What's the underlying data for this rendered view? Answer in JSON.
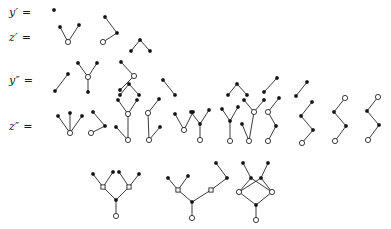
{
  "figure": {
    "kind": "rooted-tree-diagram",
    "background_color": "#ffffff",
    "ink_color": "#1a1a1a",
    "node_legend": {
      "filled_circle": "y-component vertex (solid black dot)",
      "hollow_circle": "z-component vertex (open circle)",
      "hollow_square": "intermediate branching vertex (open square)"
    }
  },
  "rows": [
    {
      "id": "row-y-prime",
      "label": "y′ =",
      "label_x": 9,
      "label_y": 6,
      "tree_count": 1
    },
    {
      "id": "row-z-prime",
      "label": "z′ =",
      "label_x": 9,
      "label_y": 31,
      "tree_count": 3
    },
    {
      "id": "row-y-dprime",
      "label": "y″ =",
      "label_x": 9,
      "label_y": 74,
      "tree_count": 8
    },
    {
      "id": "row-z-dprime",
      "label": "z″ =",
      "label_x": 9,
      "label_y": 120,
      "tree_count": 15
    }
  ],
  "geometry": {
    "dot_radius": 1.7,
    "circle_radius": 2.6,
    "square_size": 4.2,
    "edge_width": 0.85
  },
  "trees": [
    {
      "row": "row-y-prime",
      "name": "tree-y1-single-dot",
      "nodes": [
        {
          "x": 54,
          "y": 10,
          "t": "f"
        }
      ],
      "edges": []
    },
    {
      "row": "row-z-prime",
      "name": "tree-z1-cherry",
      "nodes": [
        {
          "x": 60,
          "y": 27,
          "t": "f"
        },
        {
          "x": 79,
          "y": 25,
          "t": "f"
        },
        {
          "x": 68,
          "y": 42,
          "t": "h"
        }
      ],
      "edges": [
        [
          0,
          2
        ],
        [
          1,
          2
        ]
      ]
    },
    {
      "row": "row-z-prime",
      "name": "tree-z2-path",
      "nodes": [
        {
          "x": 105,
          "y": 17,
          "t": "f"
        },
        {
          "x": 117,
          "y": 33,
          "t": "f"
        },
        {
          "x": 103,
          "y": 42,
          "t": "h"
        }
      ],
      "edges": [
        [
          0,
          1
        ],
        [
          1,
          2
        ]
      ]
    },
    {
      "row": "row-z-prime",
      "name": "tree-z3-cherry-open",
      "nodes": [
        {
          "x": 131,
          "y": 51,
          "t": "f"
        },
        {
          "x": 150,
          "y": 51,
          "t": "f"
        },
        {
          "x": 140,
          "y": 40,
          "t": "f"
        }
      ],
      "edges": [
        [
          0,
          2
        ],
        [
          1,
          2
        ]
      ]
    },
    {
      "row": "row-y-dprime",
      "name": "tree-yd1-edge",
      "nodes": [
        {
          "x": 68,
          "y": 74,
          "t": "f"
        },
        {
          "x": 55,
          "y": 91,
          "t": "f"
        }
      ],
      "edges": [
        [
          0,
          1
        ]
      ]
    },
    {
      "row": "row-y-dprime",
      "name": "tree-yd2-y-with-stem",
      "nodes": [
        {
          "x": 78,
          "y": 63,
          "t": "f"
        },
        {
          "x": 97,
          "y": 63,
          "t": "f"
        },
        {
          "x": 88,
          "y": 77,
          "t": "h"
        },
        {
          "x": 88,
          "y": 92,
          "t": "f"
        }
      ],
      "edges": [
        [
          0,
          2
        ],
        [
          1,
          2
        ],
        [
          2,
          3
        ]
      ]
    },
    {
      "row": "row-y-dprime",
      "name": "tree-yd3-zigzag-open",
      "nodes": [
        {
          "x": 121,
          "y": 62,
          "t": "f"
        },
        {
          "x": 134,
          "y": 76,
          "t": "h"
        },
        {
          "x": 120,
          "y": 90,
          "t": "f"
        }
      ],
      "edges": [
        [
          0,
          1
        ],
        [
          1,
          2
        ]
      ]
    },
    {
      "row": "row-y-dprime",
      "name": "tree-yd4-cherry",
      "nodes": [
        {
          "x": 120,
          "y": 95,
          "t": "f"
        },
        {
          "x": 139,
          "y": 95,
          "t": "f"
        },
        {
          "x": 129,
          "y": 84,
          "t": "f"
        }
      ],
      "edges": [
        [
          0,
          2
        ],
        [
          1,
          2
        ]
      ]
    },
    {
      "row": "row-y-dprime",
      "name": "tree-yd5-bend",
      "nodes": [
        {
          "x": 163,
          "y": 80,
          "t": "f"
        },
        {
          "x": 175,
          "y": 95,
          "t": "f"
        }
      ],
      "edges": [
        [
          0,
          1
        ]
      ]
    },
    {
      "row": "row-y-dprime",
      "name": "tree-yd6-cherry-right",
      "nodes": [
        {
          "x": 228,
          "y": 95,
          "t": "f"
        },
        {
          "x": 247,
          "y": 95,
          "t": "f"
        },
        {
          "x": 237,
          "y": 84,
          "t": "f"
        }
      ],
      "edges": [
        [
          0,
          2
        ],
        [
          1,
          2
        ]
      ]
    },
    {
      "row": "row-y-dprime",
      "name": "tree-yd7-chevron",
      "nodes": [
        {
          "x": 277,
          "y": 78,
          "t": "f"
        },
        {
          "x": 264,
          "y": 92,
          "t": "f"
        }
      ],
      "edges": [
        [
          0,
          1
        ]
      ]
    },
    {
      "row": "row-y-dprime",
      "name": "tree-yd8-short-edge",
      "nodes": [
        {
          "x": 307,
          "y": 82,
          "t": "f"
        },
        {
          "x": 296,
          "y": 96,
          "t": "f"
        }
      ],
      "edges": [
        [
          0,
          1
        ]
      ]
    },
    {
      "row": "row-z-dprime",
      "name": "tree-zd1-three-fan",
      "nodes": [
        {
          "x": 58,
          "y": 116,
          "t": "f"
        },
        {
          "x": 70,
          "y": 113,
          "t": "f"
        },
        {
          "x": 82,
          "y": 116,
          "t": "f"
        },
        {
          "x": 70,
          "y": 133,
          "t": "h"
        }
      ],
      "edges": [
        [
          0,
          3
        ],
        [
          1,
          3
        ],
        [
          2,
          3
        ]
      ]
    },
    {
      "row": "row-z-dprime",
      "name": "tree-zd2-path-cherry",
      "nodes": [
        {
          "x": 93,
          "y": 112,
          "t": "f"
        },
        {
          "x": 105,
          "y": 126,
          "t": "f"
        },
        {
          "x": 91,
          "y": 133,
          "t": "h"
        }
      ],
      "edges": [
        [
          0,
          1
        ],
        [
          1,
          2
        ]
      ]
    },
    {
      "row": "row-z-dprime",
      "name": "tree-zd3-double-branch",
      "nodes": [
        {
          "x": 118,
          "y": 100,
          "t": "f"
        },
        {
          "x": 137,
          "y": 100,
          "t": "f"
        },
        {
          "x": 128,
          "y": 114,
          "t": "h"
        },
        {
          "x": 116,
          "y": 127,
          "t": "f"
        },
        {
          "x": 128,
          "y": 140,
          "t": "h"
        }
      ],
      "edges": [
        [
          0,
          2
        ],
        [
          1,
          2
        ],
        [
          2,
          4
        ],
        [
          3,
          4
        ]
      ]
    },
    {
      "row": "row-z-dprime",
      "name": "tree-zd4-stem-cherry",
      "nodes": [
        {
          "x": 159,
          "y": 99,
          "t": "f"
        },
        {
          "x": 148,
          "y": 113,
          "t": "h"
        },
        {
          "x": 160,
          "y": 127,
          "t": "f"
        },
        {
          "x": 149,
          "y": 140,
          "t": "h"
        }
      ],
      "edges": [
        [
          0,
          1
        ],
        [
          1,
          3
        ],
        [
          2,
          3
        ]
      ]
    },
    {
      "row": "row-z-dprime",
      "name": "tree-zd5-v-open",
      "nodes": [
        {
          "x": 175,
          "y": 114,
          "t": "f"
        },
        {
          "x": 193,
          "y": 112,
          "t": "f"
        },
        {
          "x": 184,
          "y": 130,
          "t": "h"
        }
      ],
      "edges": [
        [
          0,
          2
        ],
        [
          1,
          2
        ]
      ]
    },
    {
      "row": "row-z-dprime",
      "name": "tree-zd6-y-stem-open",
      "nodes": [
        {
          "x": 191,
          "y": 112,
          "t": "f"
        },
        {
          "x": 209,
          "y": 110,
          "t": "f"
        },
        {
          "x": 200,
          "y": 124,
          "t": "f"
        },
        {
          "x": 200,
          "y": 140,
          "t": "h"
        }
      ],
      "edges": [
        [
          0,
          2
        ],
        [
          1,
          2
        ],
        [
          2,
          3
        ]
      ]
    },
    {
      "row": "row-z-dprime",
      "name": "tree-zd7-branch-tall",
      "nodes": [
        {
          "x": 222,
          "y": 109,
          "t": "f"
        },
        {
          "x": 238,
          "y": 107,
          "t": "f"
        },
        {
          "x": 230,
          "y": 121,
          "t": "f"
        },
        {
          "x": 230,
          "y": 141,
          "t": "h"
        }
      ],
      "edges": [
        [
          0,
          2
        ],
        [
          1,
          2
        ],
        [
          2,
          3
        ]
      ]
    },
    {
      "row": "row-z-dprime",
      "name": "tree-zd8-branch-wide",
      "nodes": [
        {
          "x": 244,
          "y": 100,
          "t": "f"
        },
        {
          "x": 264,
          "y": 100,
          "t": "f"
        },
        {
          "x": 254,
          "y": 112,
          "t": "h"
        },
        {
          "x": 242,
          "y": 124,
          "t": "f"
        },
        {
          "x": 249,
          "y": 141,
          "t": "h"
        }
      ],
      "edges": [
        [
          0,
          2
        ],
        [
          1,
          2
        ],
        [
          2,
          4
        ],
        [
          3,
          4
        ]
      ]
    },
    {
      "row": "row-z-dprime",
      "name": "tree-zd9-zig-open-top",
      "nodes": [
        {
          "x": 279,
          "y": 98,
          "t": "f"
        },
        {
          "x": 268,
          "y": 112,
          "t": "h"
        },
        {
          "x": 276,
          "y": 126,
          "t": "f"
        },
        {
          "x": 268,
          "y": 141,
          "t": "h"
        }
      ],
      "edges": [
        [
          0,
          1
        ],
        [
          1,
          2
        ],
        [
          2,
          3
        ]
      ]
    },
    {
      "row": "row-z-dprime",
      "name": "tree-zd10-zigzag-plain",
      "nodes": [
        {
          "x": 312,
          "y": 102,
          "t": "f"
        },
        {
          "x": 301,
          "y": 116,
          "t": "f"
        },
        {
          "x": 313,
          "y": 130,
          "t": "f"
        },
        {
          "x": 302,
          "y": 143,
          "t": "h"
        }
      ],
      "edges": [
        [
          0,
          1
        ],
        [
          1,
          2
        ],
        [
          2,
          3
        ]
      ]
    },
    {
      "row": "row-z-dprime",
      "name": "tree-zd11-zigzag-open-head",
      "nodes": [
        {
          "x": 345,
          "y": 98,
          "t": "h"
        },
        {
          "x": 334,
          "y": 112,
          "t": "f"
        },
        {
          "x": 346,
          "y": 126,
          "t": "f"
        },
        {
          "x": 335,
          "y": 141,
          "t": "h"
        }
      ],
      "edges": [
        [
          0,
          1
        ],
        [
          1,
          2
        ],
        [
          2,
          3
        ]
      ]
    },
    {
      "row": "row-z-dprime",
      "name": "tree-zd12-zigzag-open-head-2",
      "nodes": [
        {
          "x": 378,
          "y": 97,
          "t": "h"
        },
        {
          "x": 367,
          "y": 111,
          "t": "f"
        },
        {
          "x": 379,
          "y": 125,
          "t": "f"
        },
        {
          "x": 368,
          "y": 140,
          "t": "h"
        }
      ],
      "edges": [
        [
          0,
          1
        ],
        [
          1,
          2
        ],
        [
          2,
          3
        ]
      ]
    },
    {
      "row": "row-z-dprime",
      "name": "tree-zd13-symmetric-double",
      "nodes": [
        {
          "x": 93,
          "y": 174,
          "t": "f"
        },
        {
          "x": 113,
          "y": 172,
          "t": "f"
        },
        {
          "x": 103,
          "y": 187,
          "t": "sq"
        },
        {
          "x": 119,
          "y": 172,
          "t": "f"
        },
        {
          "x": 139,
          "y": 174,
          "t": "f"
        },
        {
          "x": 129,
          "y": 187,
          "t": "sq"
        },
        {
          "x": 116,
          "y": 200,
          "t": "f"
        },
        {
          "x": 116,
          "y": 216,
          "t": "h"
        }
      ],
      "edges": [
        [
          0,
          2
        ],
        [
          1,
          2
        ],
        [
          3,
          5
        ],
        [
          4,
          5
        ],
        [
          2,
          6
        ],
        [
          5,
          6
        ],
        [
          6,
          7
        ]
      ]
    },
    {
      "row": "row-z-dprime",
      "name": "tree-zd14-asym-double",
      "nodes": [
        {
          "x": 168,
          "y": 178,
          "t": "f"
        },
        {
          "x": 188,
          "y": 176,
          "t": "f"
        },
        {
          "x": 178,
          "y": 190,
          "t": "sq"
        },
        {
          "x": 216,
          "y": 163,
          "t": "f"
        },
        {
          "x": 227,
          "y": 178,
          "t": "f"
        },
        {
          "x": 211,
          "y": 190,
          "t": "sq"
        },
        {
          "x": 192,
          "y": 202,
          "t": "f"
        },
        {
          "x": 192,
          "y": 218,
          "t": "h"
        }
      ],
      "edges": [
        [
          0,
          2
        ],
        [
          1,
          2
        ],
        [
          3,
          4
        ],
        [
          4,
          5
        ],
        [
          2,
          6
        ],
        [
          5,
          6
        ],
        [
          6,
          7
        ]
      ]
    },
    {
      "row": "row-z-dprime",
      "name": "tree-zd15-diamond",
      "nodes": [
        {
          "x": 243,
          "y": 163,
          "t": "f"
        },
        {
          "x": 268,
          "y": 163,
          "t": "f"
        },
        {
          "x": 251,
          "y": 178,
          "t": "f"
        },
        {
          "x": 261,
          "y": 178,
          "t": "f"
        },
        {
          "x": 239,
          "y": 192,
          "t": "h"
        },
        {
          "x": 272,
          "y": 192,
          "t": "h"
        },
        {
          "x": 256,
          "y": 205,
          "t": "f"
        },
        {
          "x": 256,
          "y": 220,
          "t": "h"
        }
      ],
      "edges": [
        [
          0,
          2
        ],
        [
          1,
          3
        ],
        [
          2,
          4
        ],
        [
          2,
          5
        ],
        [
          3,
          4
        ],
        [
          3,
          5
        ],
        [
          4,
          6
        ],
        [
          5,
          6
        ],
        [
          6,
          7
        ]
      ]
    }
  ]
}
